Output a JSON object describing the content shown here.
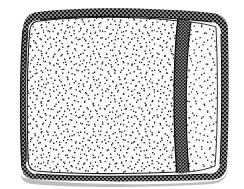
{
  "figure": {
    "title": "Stippled cushion line-art illustration",
    "subject_name": "cushion-pillow",
    "style": "pen-and-ink hatched line drawing",
    "background_color": "#ffffff",
    "ink_color": "#1a1a1a",
    "stipple_color": "#2a2a2a",
    "shadow_color": "#b4b4b4",
    "fill_color": "#fdfdfd",
    "canvas": {
      "width": 244,
      "height": 189
    },
    "parts": [
      {
        "name": "main-panel",
        "label": "Main stippled face",
        "description": "Large rounded rectangular face filled with dense random stipple dots",
        "fill": "#fdfdfd",
        "stipple_density": "high"
      },
      {
        "name": "side-panel",
        "label": "Narrow right side panel",
        "description": "Narrow vertical stippled panel to the right of the seam",
        "fill": "#fdfdfd",
        "stipple_density": "medium"
      },
      {
        "name": "piping-border",
        "label": "Mesh piping border",
        "description": "Cross-hatched woven band tracing the outer rounded edge",
        "fill": "#1a1a1a",
        "pattern": "cross-hatch-mesh"
      },
      {
        "name": "vertical-seam",
        "label": "Vertical seam",
        "description": "Hatched seam band running top to bottom near the right side",
        "fill": "#1a1a1a",
        "pattern": "cross-hatch-mesh"
      },
      {
        "name": "drop-shadow",
        "label": "Cast shadow",
        "description": "Soft grey shading under the bottom edge",
        "fill": "#b4b4b4"
      }
    ],
    "geometry": {
      "outer_left": 22,
      "outer_right": 228,
      "outer_top": 11,
      "outer_bottom": 180,
      "corner_radius": 16,
      "seam_x_top": 182,
      "seam_x_bottom": 176,
      "border_thickness": 9
    }
  },
  "icons": {
    "stipple": "stipple-texture-icon",
    "mesh": "mesh-hatch-icon"
  }
}
